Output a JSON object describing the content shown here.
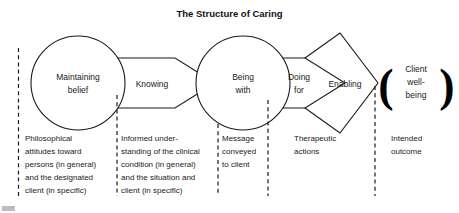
{
  "figure": {
    "title": "The Structure of Caring",
    "type": "process-flow-diagram"
  },
  "nodes": [
    {
      "id": "maintaining-belief",
      "shape": "circle",
      "line1": "Maintaining",
      "line2": "belief"
    },
    {
      "id": "knowing",
      "shape": "chevron",
      "line1": "Knowing",
      "line2": ""
    },
    {
      "id": "being-with",
      "shape": "circle",
      "line1": "Being",
      "line2": "with"
    },
    {
      "id": "doing-for",
      "shape": "chevron",
      "line1": "Doing",
      "line2": "for"
    },
    {
      "id": "enabling",
      "shape": "chevron",
      "line1": "Enabling",
      "line2": ""
    }
  ],
  "outcome": {
    "id": "client-well-being",
    "line1": "Client",
    "line2": "well-",
    "line3": "being",
    "left_bracket": "(",
    "right_bracket": ")"
  },
  "captions": [
    {
      "id": "philosophical-attitudes",
      "lines": [
        "Philosophical",
        "attitudes toward",
        "persons (in general)",
        "and the designated",
        "client (in specific)"
      ]
    },
    {
      "id": "informed-understanding",
      "lines": [
        "Informed under-",
        "standing of the clinical",
        "condition (in general)",
        "and the situation and",
        "client (in specific)"
      ]
    },
    {
      "id": "message-conveyed",
      "lines": [
        "Message",
        "conveyed",
        "to client"
      ]
    },
    {
      "id": "therapeutic-actions",
      "lines": [
        "Therapeutic",
        "actions"
      ]
    },
    {
      "id": "intended-outcome",
      "lines": [
        "Intended",
        "outcome"
      ]
    }
  ],
  "colors": {
    "stroke": "#1a1a1a",
    "background": "#ffffff",
    "text": "#1a1a1a"
  }
}
